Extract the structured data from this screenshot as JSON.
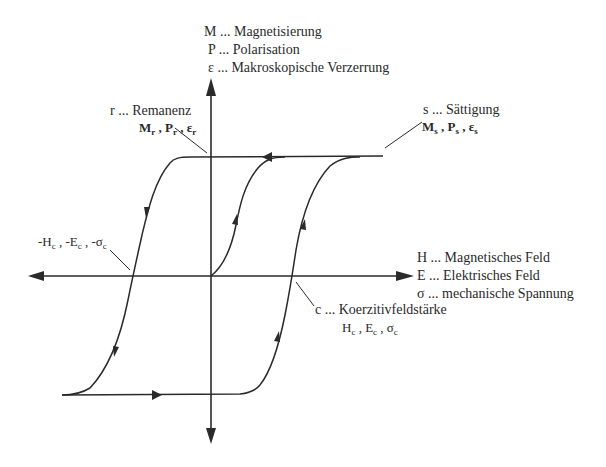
{
  "diagram": {
    "type": "hysteresis-loop",
    "colors": {
      "line": "#2a2a2a",
      "background": "#ffffff"
    },
    "y_axis_legend": [
      {
        "symbol": "M",
        "text": "M ... Magnetisierung"
      },
      {
        "symbol": "P",
        "text": "P ... Polarisation"
      },
      {
        "symbol": "ε",
        "text": "ε ... Makroskopische Verzerrung"
      }
    ],
    "x_axis_legend": [
      {
        "symbol": "H",
        "text": "H ... Magnetisches Feld"
      },
      {
        "symbol": "E",
        "text": "E ... Elektrisches Feld"
      },
      {
        "symbol": "σ",
        "text": "σ ... mechanische Spannung"
      }
    ],
    "annotations": {
      "remanenz": {
        "title": "r ... Remanenz",
        "symbols": [
          "M",
          "P",
          "ε"
        ],
        "subscript": "r"
      },
      "saettigung": {
        "title": "s ... Sättigung",
        "symbols": [
          "M",
          "P",
          "ε"
        ],
        "subscript": "s"
      },
      "neg_coercive": {
        "symbols": [
          "-H",
          "-E",
          "-σ"
        ],
        "subscript": "c"
      },
      "koerzitiv": {
        "title": "c ... Koerzitivfeldstärke",
        "symbols": [
          "H",
          "E",
          "σ"
        ],
        "subscript": "c"
      }
    },
    "separator": " , "
  }
}
